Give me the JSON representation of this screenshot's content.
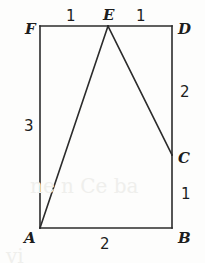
{
  "figure": {
    "type": "geometry-diagram",
    "stroke_color": "#2b2b2b",
    "background_color": "#fdfdfc",
    "vertices": [
      {
        "name": "F",
        "label": "F",
        "x": 40,
        "y": 26,
        "label_x": 25,
        "label_y": 22
      },
      {
        "name": "E",
        "label": "E",
        "x": 108,
        "y": 26,
        "label_x": 103,
        "label_y": 8
      },
      {
        "name": "D",
        "label": "D",
        "x": 172,
        "y": 26,
        "label_x": 178,
        "label_y": 22
      },
      {
        "name": "C",
        "label": "C",
        "x": 172,
        "y": 155,
        "label_x": 178,
        "label_y": 151
      },
      {
        "name": "B",
        "label": "B",
        "x": 172,
        "y": 228,
        "label_x": 178,
        "label_y": 231
      },
      {
        "name": "A",
        "label": "A",
        "x": 40,
        "y": 228,
        "label_x": 24,
        "label_y": 231
      }
    ],
    "edges": [
      {
        "name": "segment-F-E",
        "from": "F",
        "to": "E"
      },
      {
        "name": "segment-E-D",
        "from": "E",
        "to": "D"
      },
      {
        "name": "segment-D-C",
        "from": "D",
        "to": "C"
      },
      {
        "name": "segment-C-B",
        "from": "C",
        "to": "B"
      },
      {
        "name": "segment-B-A",
        "from": "B",
        "to": "A"
      },
      {
        "name": "segment-A-F",
        "from": "A",
        "to": "F"
      },
      {
        "name": "segment-A-E",
        "from": "A",
        "to": "E"
      },
      {
        "name": "segment-E-C",
        "from": "E",
        "to": "C"
      }
    ],
    "measures": [
      {
        "name": "measure-FE",
        "value": "1",
        "x": 66,
        "y": 9,
        "for": "segment-F-E"
      },
      {
        "name": "measure-ED",
        "value": "1",
        "x": 136,
        "y": 9,
        "for": "segment-E-D"
      },
      {
        "name": "measure-DC",
        "value": "2",
        "x": 180,
        "y": 85,
        "for": "segment-D-C"
      },
      {
        "name": "measure-CB",
        "value": "1",
        "x": 181,
        "y": 187,
        "for": "segment-C-B"
      },
      {
        "name": "measure-AB",
        "value": "2",
        "x": 100,
        "y": 237,
        "for": "segment-B-A"
      },
      {
        "name": "measure-AF",
        "value": "3",
        "x": 24,
        "y": 119,
        "for": "segment-A-F"
      }
    ],
    "ghost_artifacts": [
      {
        "name": "scan-ghost-1",
        "text": "ne n Ce ba",
        "x": 30,
        "y": 176
      },
      {
        "name": "scan-ghost-2",
        "text": "vi",
        "x": 6,
        "y": 246
      }
    ]
  }
}
